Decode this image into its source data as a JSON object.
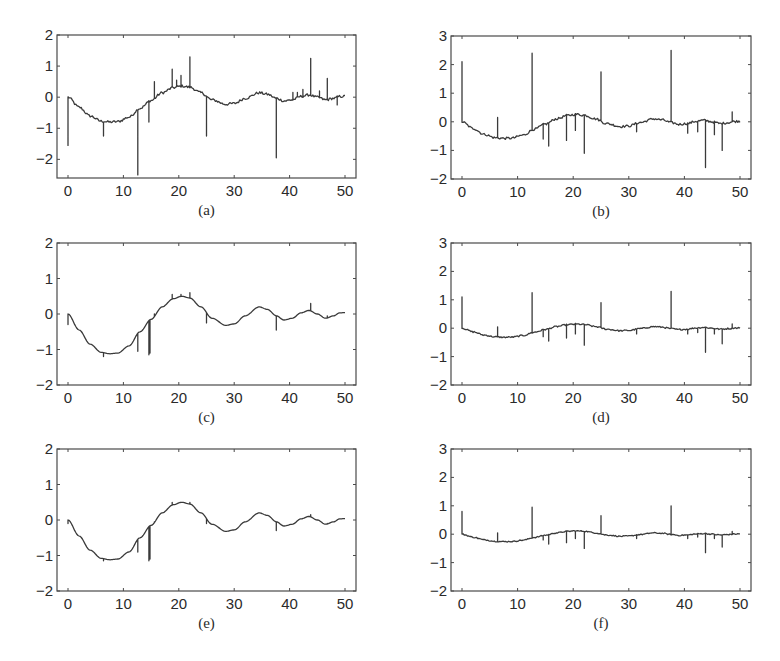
{
  "figure": {
    "panels": [
      "a",
      "b",
      "c",
      "d",
      "e",
      "f"
    ]
  },
  "chart_data": [
    {
      "id": "a",
      "caption": "(a)",
      "type": "line",
      "xlim": [
        -2,
        52
      ],
      "ylim": [
        -2.6,
        2
      ],
      "xticks": [
        0,
        10,
        20,
        30,
        40,
        50
      ],
      "yticks": [
        -2,
        -1,
        0,
        1,
        2
      ],
      "xtick_labels": [
        "0",
        "10",
        "20",
        "30",
        "40",
        "50"
      ],
      "ytick_labels": [
        "−2",
        "−1",
        "0",
        "1",
        "2"
      ],
      "grid": false,
      "base": {
        "kind": "wave",
        "amp": 0.8,
        "decay": 0.03,
        "period": 28,
        "phase": 0,
        "noise": 0.04
      },
      "spikes": [
        [
          0,
          -1.55
        ],
        [
          6.3,
          -1.25
        ],
        [
          12.5,
          -2.5
        ],
        [
          14.6,
          -0.8
        ],
        [
          15.6,
          0.5
        ],
        [
          18.8,
          0.9
        ],
        [
          19.5,
          0.55
        ],
        [
          20.3,
          0.7
        ],
        [
          21.9,
          1.3
        ],
        [
          25.0,
          -1.25
        ],
        [
          37.6,
          -1.95
        ],
        [
          40.6,
          0.15
        ],
        [
          41.3,
          0.15
        ],
        [
          42.3,
          0.25
        ],
        [
          43.8,
          1.25
        ],
        [
          45.4,
          0.2
        ],
        [
          46.8,
          0.6
        ],
        [
          48.5,
          -0.25
        ]
      ]
    },
    {
      "id": "b",
      "caption": "(b)",
      "type": "line",
      "xlim": [
        -2,
        52
      ],
      "ylim": [
        -2,
        3
      ],
      "xticks": [
        0,
        10,
        20,
        30,
        40,
        50
      ],
      "yticks": [
        -2,
        -1,
        0,
        1,
        2,
        3
      ],
      "xtick_labels": [
        "0",
        "10",
        "20",
        "30",
        "40",
        "50"
      ],
      "ytick_labels": [
        "−2",
        "−1",
        "0",
        "1",
        "2",
        "3"
      ],
      "grid": false,
      "base": {
        "kind": "wave",
        "amp": 0.58,
        "decay": 0.03,
        "period": 28,
        "phase": 0,
        "noise": 0.04
      },
      "spikes": [
        [
          0,
          2.1
        ],
        [
          6.3,
          0.15
        ],
        [
          12.5,
          2.4
        ],
        [
          14.6,
          -0.6
        ],
        [
          15.6,
          -0.85
        ],
        [
          18.8,
          -0.65
        ],
        [
          20.3,
          -0.3
        ],
        [
          21.9,
          -1.1
        ],
        [
          25.0,
          1.75
        ],
        [
          31.3,
          -0.35
        ],
        [
          37.6,
          2.5
        ],
        [
          40.6,
          -0.4
        ],
        [
          42.3,
          -0.35
        ],
        [
          43.8,
          -1.6
        ],
        [
          45.4,
          -0.45
        ],
        [
          46.8,
          -1.0
        ],
        [
          48.5,
          0.35
        ]
      ]
    },
    {
      "id": "c",
      "caption": "(c)",
      "type": "line",
      "xlim": [
        -2,
        52
      ],
      "ylim": [
        -2,
        2
      ],
      "xticks": [
        0,
        10,
        20,
        30,
        40,
        50
      ],
      "yticks": [
        -2,
        -1,
        0,
        1,
        2
      ],
      "xtick_labels": [
        "0",
        "10",
        "20",
        "30",
        "40",
        "50"
      ],
      "ytick_labels": [
        "−2",
        "−1",
        "0",
        "1",
        "2"
      ],
      "grid": false,
      "base": {
        "kind": "bessel",
        "amp": 1.0,
        "noise": 0.0
      },
      "spikes": [
        [
          0,
          -0.3
        ],
        [
          6.3,
          -1.2
        ],
        [
          12.5,
          -1.05
        ],
        [
          14.6,
          -1.15
        ],
        [
          14.8,
          -1.1
        ],
        [
          15.6,
          0.0
        ],
        [
          18.8,
          0.55
        ],
        [
          20.3,
          0.55
        ],
        [
          21.9,
          0.6
        ],
        [
          25.0,
          -0.25
        ],
        [
          37.6,
          -0.45
        ],
        [
          43.8,
          0.3
        ],
        [
          46.8,
          -0.05
        ]
      ]
    },
    {
      "id": "d",
      "caption": "(d)",
      "type": "line",
      "xlim": [
        -2,
        52
      ],
      "ylim": [
        -2,
        3
      ],
      "xticks": [
        0,
        10,
        20,
        30,
        40,
        50
      ],
      "yticks": [
        -2,
        -1,
        0,
        1,
        2,
        3
      ],
      "xtick_labels": [
        "0",
        "10",
        "20",
        "30",
        "40",
        "50"
      ],
      "ytick_labels": [
        "−2",
        "−1",
        "0",
        "1",
        "2",
        "3"
      ],
      "grid": false,
      "base": {
        "kind": "wave",
        "amp": 0.32,
        "decay": 0.03,
        "period": 28,
        "phase": 0,
        "noise": 0.025
      },
      "spikes": [
        [
          0,
          1.1
        ],
        [
          6.3,
          0.05
        ],
        [
          12.5,
          1.25
        ],
        [
          14.6,
          -0.3
        ],
        [
          15.6,
          -0.45
        ],
        [
          18.8,
          -0.35
        ],
        [
          20.3,
          -0.2
        ],
        [
          21.9,
          -0.6
        ],
        [
          25.0,
          0.9
        ],
        [
          31.3,
          -0.2
        ],
        [
          37.6,
          1.3
        ],
        [
          40.6,
          -0.2
        ],
        [
          42.3,
          -0.15
        ],
        [
          43.8,
          -0.85
        ],
        [
          45.4,
          -0.2
        ],
        [
          46.8,
          -0.55
        ],
        [
          48.5,
          0.15
        ]
      ]
    },
    {
      "id": "e",
      "caption": "(e)",
      "type": "line",
      "xlim": [
        -2,
        52
      ],
      "ylim": [
        -2,
        2
      ],
      "xticks": [
        0,
        10,
        20,
        30,
        40,
        50
      ],
      "yticks": [
        -2,
        -1,
        0,
        1,
        2
      ],
      "xtick_labels": [
        "0",
        "10",
        "20",
        "30",
        "40",
        "50"
      ],
      "ytick_labels": [
        "−2",
        "−1",
        "0",
        "1",
        "2"
      ],
      "grid": false,
      "base": {
        "kind": "bessel",
        "amp": 1.0,
        "noise": 0.0
      },
      "spikes": [
        [
          0,
          -0.1
        ],
        [
          6.3,
          -1.15
        ],
        [
          12.5,
          -0.9
        ],
        [
          14.6,
          -1.15
        ],
        [
          14.8,
          -1.1
        ],
        [
          15.6,
          -0.05
        ],
        [
          18.8,
          0.5
        ],
        [
          21.9,
          0.5
        ],
        [
          25.0,
          -0.1
        ],
        [
          37.6,
          -0.3
        ],
        [
          43.8,
          0.15
        ],
        [
          46.8,
          -0.1
        ]
      ]
    },
    {
      "id": "f",
      "caption": "(f)",
      "type": "line",
      "xlim": [
        -2,
        52
      ],
      "ylim": [
        -2,
        3
      ],
      "xticks": [
        0,
        10,
        20,
        30,
        40,
        50
      ],
      "yticks": [
        -2,
        -1,
        0,
        1,
        2,
        3
      ],
      "xtick_labels": [
        "0",
        "10",
        "20",
        "30",
        "40",
        "50"
      ],
      "ytick_labels": [
        "−2",
        "−1",
        "0",
        "1",
        "2",
        "3"
      ],
      "grid": false,
      "base": {
        "kind": "wave",
        "amp": 0.26,
        "decay": 0.03,
        "period": 28,
        "phase": 0,
        "noise": 0.02
      },
      "spikes": [
        [
          0,
          0.8
        ],
        [
          6.3,
          0.05
        ],
        [
          12.5,
          0.95
        ],
        [
          14.6,
          -0.2
        ],
        [
          15.6,
          -0.35
        ],
        [
          18.8,
          -0.3
        ],
        [
          20.3,
          -0.15
        ],
        [
          21.9,
          -0.5
        ],
        [
          25.0,
          0.65
        ],
        [
          31.3,
          -0.15
        ],
        [
          37.6,
          1.0
        ],
        [
          40.6,
          -0.15
        ],
        [
          42.3,
          -0.1
        ],
        [
          43.8,
          -0.65
        ],
        [
          45.4,
          -0.15
        ],
        [
          46.8,
          -0.45
        ],
        [
          48.5,
          0.1
        ]
      ]
    }
  ]
}
